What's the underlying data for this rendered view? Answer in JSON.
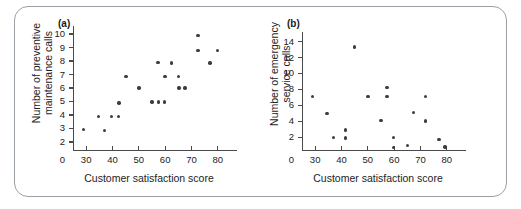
{
  "figure": {
    "panels": [
      {
        "key": "a",
        "label": "(a)",
        "xlabel": "Customer satisfaction score",
        "ylabel_line1": "Number of preventive",
        "ylabel_line2": "maintenance calls"
      },
      {
        "key": "b",
        "label": "(b)",
        "xlabel": "Customer satisfaction score",
        "ylabel_line1": "Number of emergency",
        "ylabel_line2": "service calls"
      }
    ],
    "colors": {
      "marker": "#3d3d3d",
      "axis": "#4a4a4a",
      "frame": "#9aa0a6",
      "background": "#ffffff",
      "text": "#1d1d1d"
    }
  },
  "chart_data": [
    {
      "type": "scatter",
      "panel": "a",
      "title": "(a)",
      "xlabel": "Customer satisfaction score",
      "ylabel": "Number of preventive maintenance calls",
      "xlim": [
        25,
        85
      ],
      "ylim": [
        1.4,
        10.6
      ],
      "xticks": [
        30,
        40,
        50,
        60,
        70,
        80
      ],
      "xticklabels": [
        "30",
        "40",
        "50",
        "60",
        "70",
        "80"
      ],
      "yticks": [
        2,
        3,
        4,
        5,
        6,
        7,
        8,
        9,
        10
      ],
      "yticklabels": [
        "2",
        "3",
        "4",
        "5",
        "6",
        "7",
        "8",
        "9",
        "10"
      ],
      "origin_labels": {
        "x": "0",
        "y": "0"
      },
      "grid": false,
      "legend": null,
      "points": [
        {
          "x": 29.0,
          "y": 2.9
        },
        {
          "x": 34.7,
          "y": 3.9
        },
        {
          "x": 37.0,
          "y": 2.85
        },
        {
          "x": 39.6,
          "y": 3.9
        },
        {
          "x": 42.2,
          "y": 3.9
        },
        {
          "x": 42.5,
          "y": 4.9
        },
        {
          "x": 45.2,
          "y": 6.85
        },
        {
          "x": 50.0,
          "y": 6.0
        },
        {
          "x": 55.0,
          "y": 4.95
        },
        {
          "x": 57.3,
          "y": 7.9
        },
        {
          "x": 57.5,
          "y": 4.95
        },
        {
          "x": 59.8,
          "y": 4.95
        },
        {
          "x": 59.9,
          "y": 6.85
        },
        {
          "x": 62.4,
          "y": 7.85
        },
        {
          "x": 65.0,
          "y": 6.85
        },
        {
          "x": 65.2,
          "y": 6.0
        },
        {
          "x": 67.6,
          "y": 6.0
        },
        {
          "x": 72.4,
          "y": 9.9
        },
        {
          "x": 72.5,
          "y": 8.8
        },
        {
          "x": 77.0,
          "y": 7.85
        },
        {
          "x": 79.8,
          "y": 8.8
        }
      ]
    },
    {
      "type": "scatter",
      "panel": "b",
      "title": "(b)",
      "xlabel": "Customer satisfaction score",
      "ylabel": "Number of emergency service calls",
      "xlim": [
        25,
        85
      ],
      "ylim": [
        0.4,
        15.2
      ],
      "xticks": [
        30,
        40,
        50,
        60,
        70,
        80
      ],
      "xticklabels": [
        "30",
        "40",
        "50",
        "60",
        "70",
        "80"
      ],
      "yticks": [
        2,
        4,
        6,
        8,
        10,
        12,
        14
      ],
      "yticklabels": [
        "2",
        "4",
        "6",
        "8",
        "10",
        "12",
        "14"
      ],
      "origin_labels": {
        "x": "0",
        "y": "0"
      },
      "grid": false,
      "legend": null,
      "points": [
        {
          "x": 29.0,
          "y": 7.1
        },
        {
          "x": 34.5,
          "y": 5.0
        },
        {
          "x": 37.0,
          "y": 2.0
        },
        {
          "x": 41.6,
          "y": 2.9
        },
        {
          "x": 41.6,
          "y": 1.9
        },
        {
          "x": 45.0,
          "y": 13.3
        },
        {
          "x": 50.0,
          "y": 7.1
        },
        {
          "x": 55.0,
          "y": 4.1
        },
        {
          "x": 57.3,
          "y": 8.25
        },
        {
          "x": 57.3,
          "y": 7.1
        },
        {
          "x": 59.7,
          "y": 2.0
        },
        {
          "x": 59.8,
          "y": 0.75
        },
        {
          "x": 65.0,
          "y": 0.95
        },
        {
          "x": 67.3,
          "y": 5.1
        },
        {
          "x": 72.0,
          "y": 7.1
        },
        {
          "x": 72.0,
          "y": 4.05
        },
        {
          "x": 77.0,
          "y": 1.7
        },
        {
          "x": 79.3,
          "y": 0.8
        }
      ]
    }
  ]
}
